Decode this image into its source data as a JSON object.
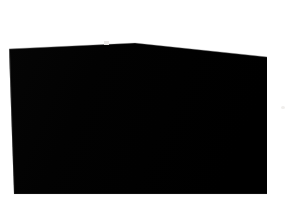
{
  "scene": {
    "kind": "photograph-of-screen",
    "description": "Photograph of a laptop display that is entirely black, shot straight-on against a plain white background.",
    "background_color": "#ffffff"
  },
  "display": {
    "name": "screen-panel",
    "state_label": "Blank black screen",
    "content_text": "",
    "screen_color": "#030303",
    "bezel_color": "#0a0a0a",
    "edge_highlight_color": "#3a3a3a",
    "corners": {
      "top_left": {
        "x": 9,
        "y": 49
      },
      "top_apex": {
        "x": 135,
        "y": 43
      },
      "top_right": {
        "x": 267,
        "y": 57
      },
      "bottom_right": {
        "x": 267,
        "y": 194
      },
      "bottom_left": {
        "x": 14,
        "y": 194
      }
    }
  },
  "marks": {
    "webcam_notch": {
      "x": 106,
      "y": 43,
      "color": "#e9e7e5"
    },
    "background_speck": {
      "x": 283,
      "y": 108,
      "color": "#f0eeec"
    }
  },
  "canvas": {
    "width": 292,
    "height": 199
  }
}
